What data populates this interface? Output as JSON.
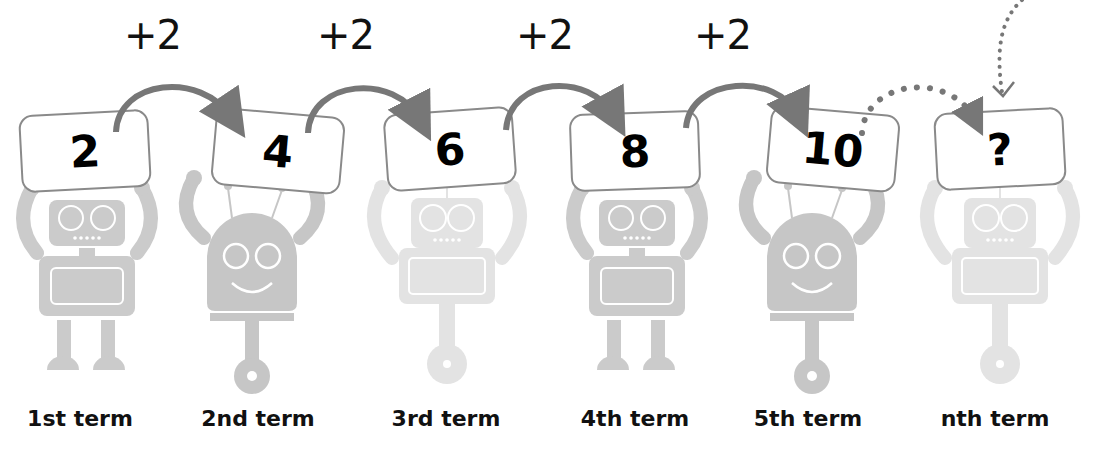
{
  "diagram": {
    "type": "arithmetic-sequence",
    "common_difference_label": "+2",
    "colors": {
      "arrow": "#777777",
      "card_border": "#8a8a8a",
      "robot_dark": "#c8c8c8",
      "robot_light": "#e4e4e4",
      "text": "#111111"
    },
    "steps": [
      {
        "label": "+2"
      },
      {
        "label": "+2"
      },
      {
        "label": "+2"
      },
      {
        "label": "+2"
      }
    ],
    "terms": [
      {
        "value": "2",
        "label": "1st term",
        "robot": "square-legs",
        "shade": "dark"
      },
      {
        "value": "4",
        "label": "2nd term",
        "robot": "round-wheel",
        "shade": "dark"
      },
      {
        "value": "6",
        "label": "3rd term",
        "robot": "square-wheel",
        "shade": "light"
      },
      {
        "value": "8",
        "label": "4th term",
        "robot": "square-legs",
        "shade": "dark"
      },
      {
        "value": "10",
        "label": "5th term",
        "robot": "round-wheel",
        "shade": "dark"
      },
      {
        "value": "?",
        "label": "nth term",
        "robot": "square-wheel",
        "shade": "light"
      }
    ]
  }
}
